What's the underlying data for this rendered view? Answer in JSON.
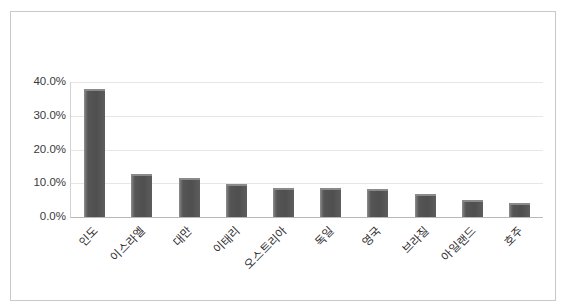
{
  "chart_data": {
    "type": "bar",
    "title": "",
    "subtitle": "",
    "xlabel": "",
    "ylabel": "",
    "categories": [
      "인도",
      "이스라엘",
      "대만",
      "이태리",
      "오스트리아",
      "독일",
      "영국",
      "브라질",
      "아일랜드",
      "호주"
    ],
    "values": [
      38.0,
      12.8,
      11.6,
      9.7,
      8.6,
      8.5,
      8.3,
      6.9,
      5.0,
      4.0
    ],
    "value_unit": "%",
    "ylim": [
      0,
      40
    ],
    "ytick_values": [
      0,
      10,
      20,
      30,
      40
    ],
    "ytick_labels": [
      "0.0%",
      "10.0%",
      "20.0%",
      "30.0%",
      "40.0%"
    ],
    "grid": "horizontal",
    "legend": "none",
    "series_color": "#555555",
    "gridline_color": "#e6e6e6",
    "plot_background": "#ffffff",
    "border_color": "#c9c9c9",
    "xtick_label_rotation": -45
  }
}
